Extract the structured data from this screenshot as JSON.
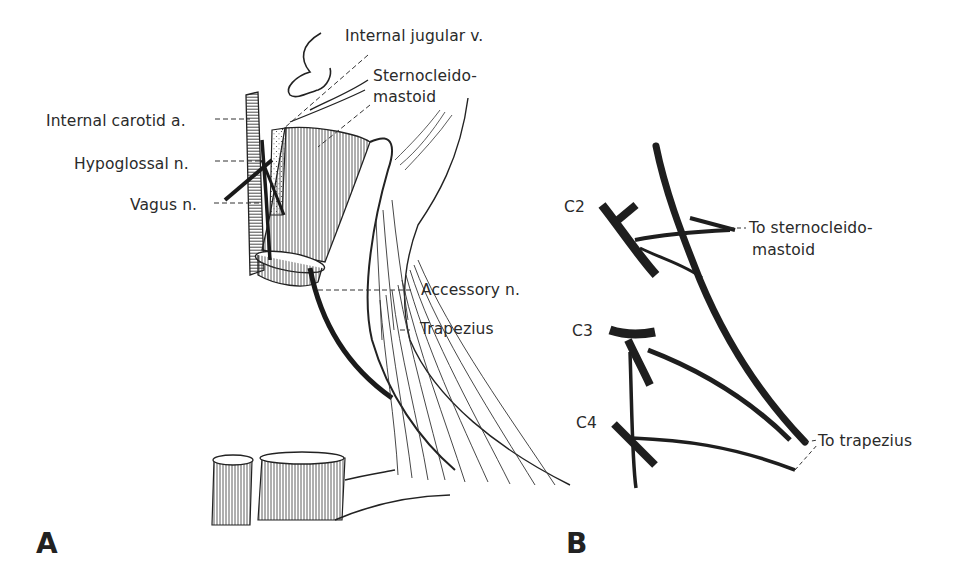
{
  "figure": {
    "panels": [
      {
        "id": "A",
        "letter": "A",
        "labels": {
          "internal_jugular": "Internal jugular v.",
          "sternocleido_1": "Sternocleido-",
          "sternocleido_2": "mastoid",
          "internal_carotid": "Internal carotid a.",
          "hypoglossal": "Hypoglossal n.",
          "vagus": "Vagus n.",
          "accessory": "Accessory n.",
          "trapezius": "Trapezius"
        }
      },
      {
        "id": "B",
        "letter": "B",
        "labels": {
          "c2": "C2",
          "c3": "C3",
          "c4": "C4",
          "to_scm_1": "To sternocleido-",
          "to_scm_2": "mastoid",
          "to_trapezius": "To trapezius"
        }
      }
    ],
    "colors": {
      "ink": "#1e1e1e",
      "background": "#ffffff"
    }
  }
}
